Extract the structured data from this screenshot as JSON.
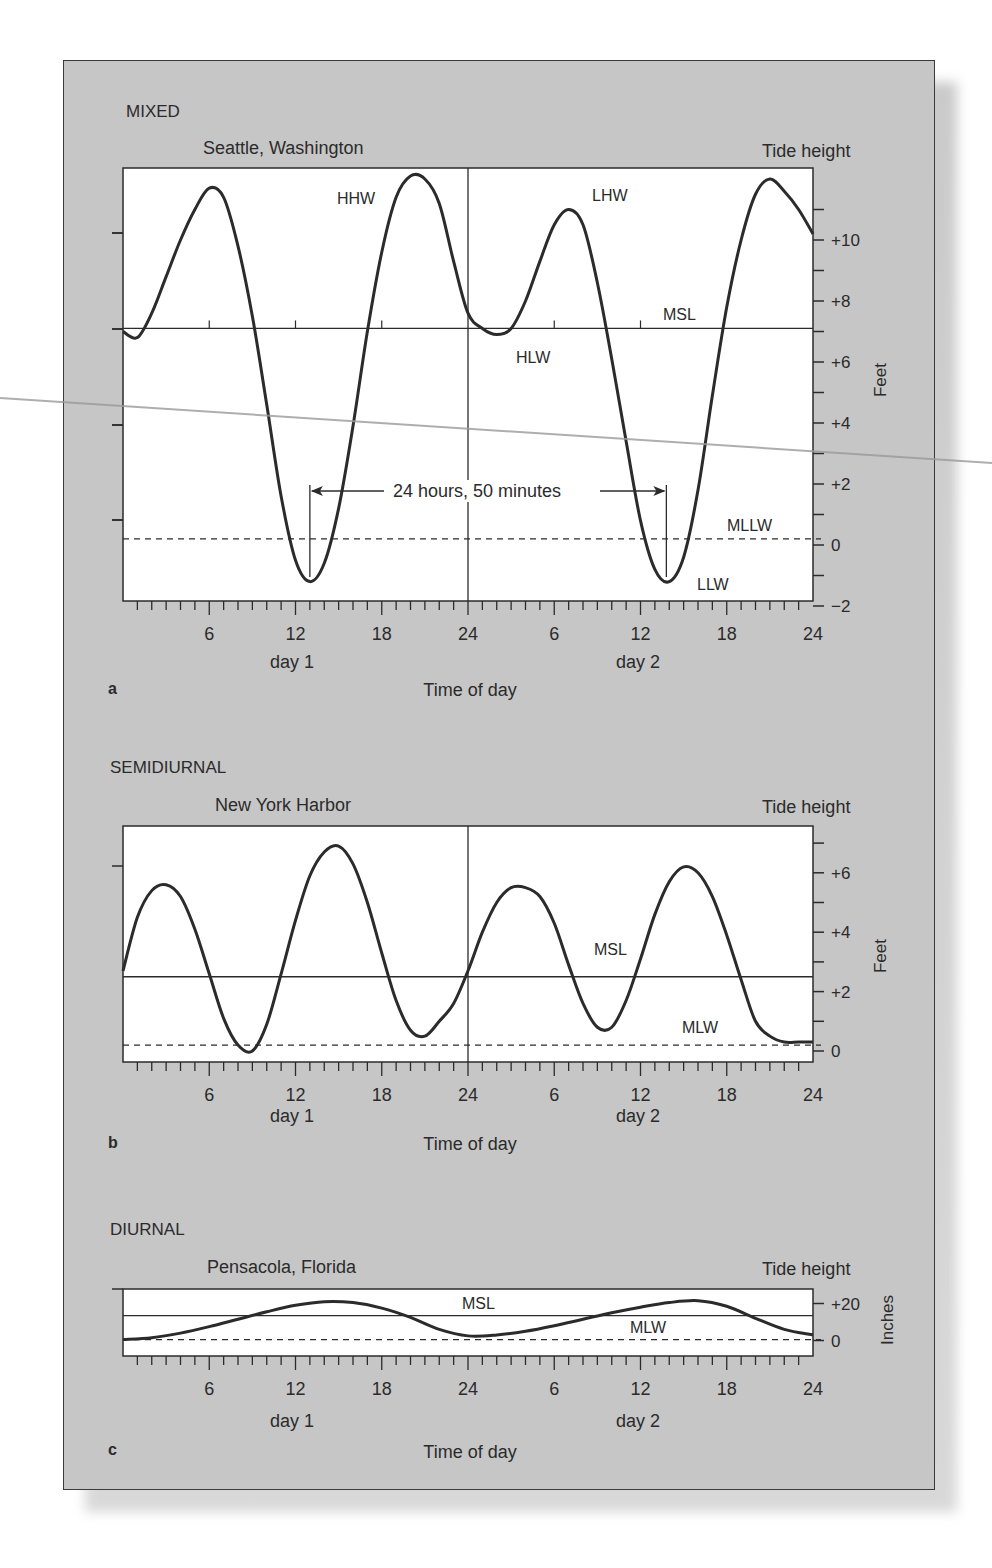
{
  "figure": {
    "shadow_color": "#bdbdbd",
    "card_color": "#c6c6c6",
    "plot_bg": "#ffffff",
    "ink_color": "#2b2b2b"
  },
  "panels": [
    {
      "id": "a",
      "type_label": "MIXED",
      "location": "Seattle, Washington",
      "right_title": "Tide height",
      "unit_label": "Feet",
      "x_ticks": [
        "6",
        "12",
        "18",
        "24",
        "6",
        "12",
        "18",
        "24"
      ],
      "day_labels": [
        "day 1",
        "day 2"
      ],
      "x_title": "Time of day",
      "panel_letter": "a",
      "y_ticks": [
        "+10",
        "+8",
        "+6",
        "+4",
        "+2",
        "0",
        "−2"
      ],
      "annotations": {
        "hhw": "HHW",
        "lhw": "LHW",
        "hlw": "HLW",
        "llw": "LLW",
        "msl": "MSL",
        "datum": "MLLW",
        "interval": "24 hours, 50 minutes"
      }
    },
    {
      "id": "b",
      "type_label": "SEMIDIURNAL",
      "location": "New York Harbor",
      "right_title": "Tide height",
      "unit_label": "Feet",
      "x_ticks": [
        "6",
        "12",
        "18",
        "24",
        "6",
        "12",
        "18",
        "24"
      ],
      "day_labels": [
        "day 1",
        "day 2"
      ],
      "x_title": "Time of day",
      "panel_letter": "b",
      "y_ticks": [
        "+6",
        "+4",
        "+2",
        "0"
      ],
      "annotations": {
        "msl": "MSL",
        "datum": "MLW"
      }
    },
    {
      "id": "c",
      "type_label": "DIURNAL",
      "location": "Pensacola, Florida",
      "right_title": "Tide height",
      "unit_label": "Inches",
      "x_ticks": [
        "6",
        "12",
        "18",
        "24",
        "6",
        "12",
        "18",
        "24"
      ],
      "day_labels": [
        "day 1",
        "day 2"
      ],
      "x_title": "Time of day",
      "panel_letter": "c",
      "y_ticks": [
        "+20",
        "0"
      ],
      "annotations": {
        "msl": "MSL",
        "datum": "MLW"
      }
    }
  ],
  "chart_data": [
    {
      "type": "line",
      "title": "MIXED — Seattle, Washington",
      "xlabel": "Time of day (hours, day 1 and day 2)",
      "ylabel": "Tide height (Feet)",
      "xlim": [
        0,
        48
      ],
      "ylim": [
        -2,
        12
      ],
      "grid": false,
      "reference_lines": {
        "MSL": 7.1,
        "MLLW": 0.2
      },
      "annotations": [
        {
          "text": "HHW",
          "x": 20.5,
          "y": 12.1
        },
        {
          "text": "LHW",
          "x": 31,
          "y": 10.8
        },
        {
          "text": "HLW",
          "x": 26,
          "y": 6.9
        },
        {
          "text": "LLW",
          "x": 38,
          "y": -1.2
        },
        {
          "text": "24 hours, 50 minutes",
          "x_start": 13,
          "x_end": 37.8
        }
      ],
      "series": [
        {
          "name": "Tide height",
          "x": [
            0,
            1,
            2,
            3,
            4,
            5,
            6,
            7,
            8,
            9,
            10,
            11,
            12,
            13,
            14,
            15,
            16,
            17,
            18,
            19,
            20,
            21,
            22,
            23,
            24,
            25,
            26,
            27,
            28,
            29,
            30,
            31,
            32,
            33,
            34,
            35,
            36,
            37,
            38,
            39,
            40,
            41,
            42,
            43,
            44,
            45,
            46,
            47,
            48
          ],
          "values": [
            7.0,
            6.8,
            7.6,
            8.8,
            10.0,
            11.0,
            11.7,
            11.4,
            9.8,
            7.5,
            4.6,
            1.6,
            -0.5,
            -1.2,
            -0.6,
            1.2,
            3.9,
            7.0,
            9.6,
            11.4,
            12.1,
            12.0,
            11.2,
            9.3,
            7.6,
            7.1,
            6.9,
            7.1,
            8.0,
            9.3,
            10.5,
            11.0,
            10.5,
            8.6,
            6.1,
            3.4,
            0.8,
            -0.8,
            -1.2,
            -0.4,
            1.8,
            4.9,
            7.8,
            10.0,
            11.5,
            12.0,
            11.6,
            11.0,
            10.2
          ]
        }
      ]
    },
    {
      "type": "line",
      "title": "SEMIDIURNAL — New York Harbor",
      "xlabel": "Time of day (hours, day 1 and day 2)",
      "ylabel": "Tide height (Feet)",
      "xlim": [
        0,
        48
      ],
      "ylim": [
        -0.5,
        7.5
      ],
      "grid": false,
      "reference_lines": {
        "MSL": 2.5,
        "MLW": 0.2
      },
      "series": [
        {
          "name": "Tide height",
          "x": [
            0,
            1,
            2,
            3,
            4,
            5,
            6,
            7,
            8,
            9,
            10,
            11,
            12,
            13,
            14,
            15,
            16,
            17,
            18,
            19,
            20,
            21,
            22,
            23,
            24,
            25,
            26,
            27,
            28,
            29,
            30,
            31,
            32,
            33,
            34,
            35,
            36,
            37,
            38,
            39,
            40,
            41,
            42,
            43,
            44,
            45,
            46,
            47,
            48
          ],
          "values": [
            2.7,
            4.5,
            5.4,
            5.6,
            5.2,
            4.1,
            2.6,
            1.1,
            0.2,
            0.0,
            0.9,
            2.6,
            4.4,
            5.9,
            6.7,
            6.9,
            6.3,
            5.0,
            3.3,
            1.7,
            0.7,
            0.5,
            1.0,
            1.6,
            2.7,
            4.0,
            5.0,
            5.5,
            5.5,
            5.2,
            4.3,
            2.9,
            1.6,
            0.8,
            0.8,
            1.7,
            3.1,
            4.6,
            5.7,
            6.2,
            6.0,
            5.2,
            3.9,
            2.4,
            1.0,
            0.5,
            0.3,
            0.3,
            0.3
          ]
        }
      ]
    },
    {
      "type": "line",
      "title": "DIURNAL — Pensacola, Florida",
      "xlabel": "Time of day (hours, day 1 and day 2)",
      "ylabel": "Tide height (Inches)",
      "xlim": [
        0,
        48
      ],
      "ylim": [
        -1,
        26
      ],
      "grid": false,
      "reference_lines": {
        "MSL": 13.5,
        "MLW": 0.5
      },
      "series": [
        {
          "name": "Tide height",
          "x": [
            0,
            2,
            4,
            6,
            8,
            10,
            12,
            14,
            16,
            18,
            20,
            22,
            24,
            26,
            28,
            30,
            32,
            34,
            36,
            38,
            40,
            42,
            44,
            46,
            48
          ],
          "values": [
            0.5,
            1.5,
            4.0,
            7.5,
            11.5,
            15.5,
            19.0,
            21.0,
            20.5,
            17.5,
            12.5,
            6.0,
            2.5,
            3.0,
            5.0,
            8.0,
            11.5,
            15.0,
            18.0,
            20.5,
            21.5,
            18.5,
            12.0,
            6.0,
            3.0
          ]
        }
      ]
    }
  ]
}
